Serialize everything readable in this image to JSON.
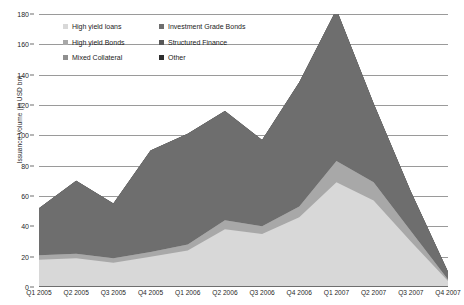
{
  "chart_data": {
    "type": "area",
    "stacked": true,
    "title": "",
    "subtitle": "",
    "xlabel": "",
    "ylabel": "Issuance Volume (in USD bn)",
    "ylim": [
      0,
      180
    ],
    "ytick_step": 20,
    "yticks": [
      0,
      20,
      40,
      60,
      80,
      100,
      120,
      140,
      160,
      180
    ],
    "grid": true,
    "legend_position": "top-left",
    "categories": [
      "Q1 2005",
      "Q2 2005",
      "Q3 2005",
      "Q4 2005",
      "Q1 2006",
      "Q2 2006",
      "Q3 2006",
      "Q4 2006",
      "Q1 2007",
      "Q2 2007",
      "Q3 2007",
      "Q4 2007"
    ],
    "series": [
      {
        "name": "High yield loans",
        "color": "#d8d8d8",
        "values": [
          18,
          19,
          16,
          20,
          24,
          38,
          35,
          46,
          69,
          57,
          30,
          4
        ]
      },
      {
        "name": "High yield Bonds",
        "color": "#a8a8a8",
        "values": [
          3,
          3,
          3,
          3,
          4,
          6,
          5,
          7,
          14,
          12,
          7,
          1
        ]
      },
      {
        "name": "Mixed Collateral",
        "color": "#8f8f8f",
        "values": [
          0,
          0,
          0,
          0,
          0,
          0,
          0,
          0,
          0,
          0,
          0,
          0
        ]
      },
      {
        "name": "Investment Grade Bonds",
        "color": "#6e6e6e",
        "values": [
          31,
          48,
          36,
          67,
          73,
          72,
          57,
          82,
          100,
          52,
          26,
          5
        ]
      },
      {
        "name": "Structured Finance",
        "color": "#575757",
        "values": [
          0,
          0,
          0,
          0,
          0,
          0,
          0,
          0,
          0,
          0,
          0,
          0
        ]
      },
      {
        "name": "Other",
        "color": "#2e2e2e",
        "values": [
          0,
          0,
          0,
          0,
          0,
          0,
          0,
          0,
          0,
          0,
          0,
          0
        ]
      }
    ],
    "totals": [
      52,
      70,
      55,
      90,
      101,
      116,
      97,
      135,
      183,
      121,
      63,
      10
    ]
  },
  "legend": {
    "items": [
      {
        "label": "High yield loans",
        "color": "#d8d8d8"
      },
      {
        "label": "Investment Grade Bonds",
        "color": "#6e6e6e"
      },
      {
        "label": "High yield Bonds",
        "color": "#a8a8a8"
      },
      {
        "label": "Structured Finance",
        "color": "#575757"
      },
      {
        "label": "Mixed Collateral",
        "color": "#8f8f8f"
      },
      {
        "label": "Other",
        "color": "#2e2e2e"
      }
    ]
  }
}
